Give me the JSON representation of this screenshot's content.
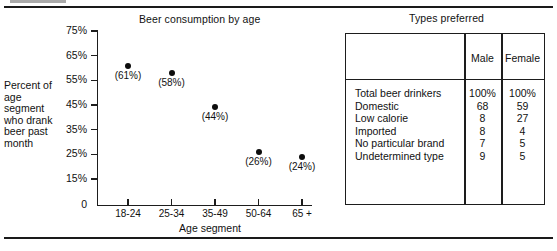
{
  "figure": {
    "top_rule": true,
    "bottom_rule": true
  },
  "chart_data": {
    "type": "scatter",
    "title": "Beer consumption by age",
    "xlabel": "Age segment",
    "ylabel": "Percent of age segment who drank beer past month",
    "categories": [
      "18-24",
      "25-34",
      "35-49",
      "50-64",
      "65 +"
    ],
    "values": [
      61,
      58,
      44,
      26,
      24
    ],
    "point_labels": [
      "(61%)",
      "(58%)",
      "(44%)",
      "(26%)",
      "(24%)"
    ],
    "ytick_labels": [
      "75%",
      "65%",
      "55%",
      "45%",
      "35%",
      "25%",
      "15%",
      "0"
    ],
    "ytick_values": [
      75,
      65,
      55,
      45,
      35,
      25,
      15,
      0
    ],
    "ylim": [
      0,
      75
    ],
    "grid": false,
    "legend": "none",
    "axis_broken_between": [
      0,
      15
    ],
    "marker_color": "#0d0d0d"
  },
  "table": {
    "title": "Types preferred",
    "columns": [
      "",
      "Male",
      "Female"
    ],
    "rows": [
      {
        "label": "Total beer drinkers",
        "male": "100%",
        "female": "100%"
      },
      {
        "label": "Domestic",
        "male": "68",
        "female": "59"
      },
      {
        "label": "Low calorie",
        "male": "8",
        "female": "27"
      },
      {
        "label": "Imported",
        "male": "8",
        "female": "4"
      },
      {
        "label": "No particular brand",
        "male": "7",
        "female": "5"
      },
      {
        "label": "Undetermined type",
        "male": "9",
        "female": "5"
      }
    ]
  }
}
